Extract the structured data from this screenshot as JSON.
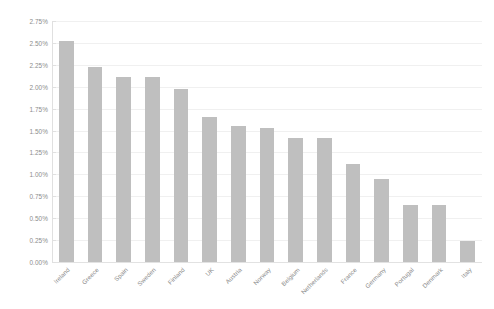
{
  "chart_data": {
    "type": "bar",
    "title": "",
    "subtitle": "",
    "xlabel": "",
    "ylabel": "",
    "categories": [
      "Ireland",
      "Greece",
      "Spain",
      "Sweden",
      "Finland",
      "UK",
      "Austria",
      "Norway",
      "Belgium",
      "Netherlands",
      "France",
      "Germany",
      "Portugal",
      "Denmark",
      "Italy"
    ],
    "values": [
      2.52,
      2.22,
      2.11,
      2.11,
      1.97,
      1.65,
      1.55,
      1.53,
      1.41,
      1.41,
      1.12,
      0.95,
      0.65,
      0.65,
      0.24
    ],
    "value_suffix": "%",
    "ylim": [
      0,
      2.75
    ],
    "ytick_step": 0.25,
    "ytick_labels": [
      "2.75%",
      "2.50%",
      "2.25%",
      "2.00%",
      "1.75%",
      "1.50%",
      "1.25%",
      "1.00%",
      "0.75%",
      "0.50%",
      "0.25%",
      "0.00%"
    ],
    "ytick_values": [
      2.75,
      2.5,
      2.25,
      2.0,
      1.75,
      1.5,
      1.25,
      1.0,
      0.75,
      0.5,
      0.25,
      0.0
    ],
    "grid": true,
    "legend": false,
    "legend_position": "none",
    "bar_color": "#bfbfbf",
    "gridline_color": "#f0f0f0",
    "axis_color": "#e0e0e0",
    "text_color": "#8c8c8c",
    "background_color": "#ffffff",
    "x_label_rotation": -45
  }
}
